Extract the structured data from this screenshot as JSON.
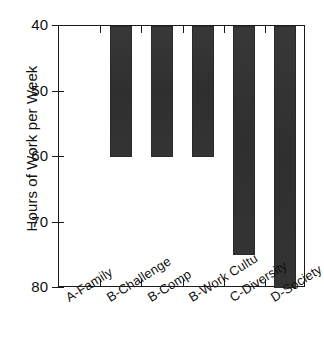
{
  "chart_data": {
    "type": "bar",
    "title": "",
    "subtitle": "",
    "xlabel": "",
    "ylabel": "Hours of Work per Week",
    "categories": [
      "A-Family",
      "B-Challenge",
      "B-Comp",
      "B-Work Cultu",
      "C-Diversity",
      "D-Society"
    ],
    "values": [
      40,
      60,
      60,
      60,
      75,
      80
    ],
    "series": [
      {
        "name": "Hours of Work per Week",
        "values": [
          40,
          60,
          60,
          60,
          75,
          80
        ]
      }
    ],
    "ylim": [
      40,
      80
    ],
    "y_axis_inverted": true,
    "yticks": [
      40,
      50,
      60,
      70,
      80
    ],
    "ytick_labels": [
      "40",
      "50",
      "60",
      "70",
      "80"
    ],
    "grid": false,
    "legend": false,
    "legend_position": "none",
    "bar_color": "#333333",
    "axis_color": "#1a1a1a",
    "background_color": "#ffffff"
  },
  "axis": {
    "y_title": "Hours of Work per Week",
    "ticks": [
      {
        "label": "40",
        "value": 40
      },
      {
        "label": "50",
        "value": 50
      },
      {
        "label": "60",
        "value": 60
      },
      {
        "label": "70",
        "value": 70
      },
      {
        "label": "80",
        "value": 80
      }
    ]
  },
  "bars": [
    {
      "label": "A-Family",
      "value": 40
    },
    {
      "label": "B-Challenge",
      "value": 60
    },
    {
      "label": "B-Comp",
      "value": 60
    },
    {
      "label": "B-Work Cultu",
      "value": 60
    },
    {
      "label": "C-Diversity",
      "value": 75
    },
    {
      "label": "D-Society",
      "value": 80
    }
  ]
}
